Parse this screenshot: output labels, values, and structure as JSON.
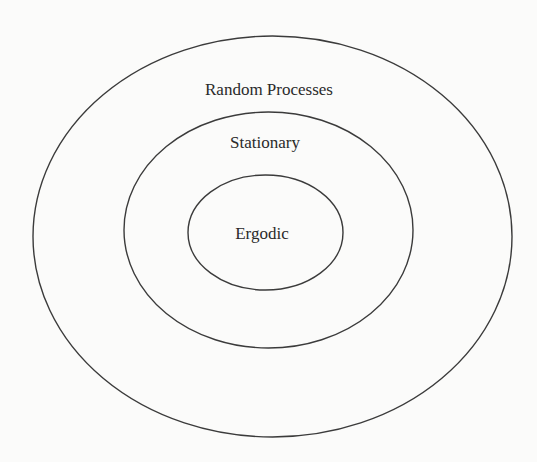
{
  "diagram": {
    "type": "nested-set-venn",
    "colors": {
      "background": "#fbfbfa",
      "stroke": "#3b3b3b",
      "text": "#2a2a2a"
    },
    "sets": [
      {
        "id": "random-processes",
        "label": "Random Processes",
        "level": 0,
        "contains": [
          "stationary"
        ]
      },
      {
        "id": "stationary",
        "label": "Stationary",
        "level": 1,
        "contains": [
          "ergodic"
        ]
      },
      {
        "id": "ergodic",
        "label": "Ergodic",
        "level": 2,
        "contains": []
      }
    ]
  }
}
